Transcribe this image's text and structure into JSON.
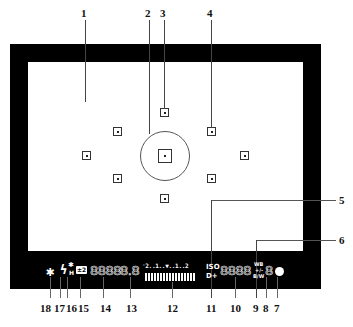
{
  "diagram": {
    "frame_color": "#000000",
    "background_color": "#ffffff",
    "callouts": [
      {
        "num": "1",
        "target": "focusing screen"
      },
      {
        "num": "2",
        "target": "spot metering circle"
      },
      {
        "num": "3",
        "target": "AF point"
      },
      {
        "num": "4",
        "target": "AF point"
      },
      {
        "num": "5",
        "target": "ISO / info indicator"
      },
      {
        "num": "6",
        "target": "WB / B/W indicator"
      },
      {
        "num": "7",
        "target": "focus confirmation light"
      },
      {
        "num": "8",
        "target": "max burst digit"
      },
      {
        "num": "9",
        "target": "WB correction / B/W indicator"
      },
      {
        "num": "10",
        "target": "ISO speed digits"
      },
      {
        "num": "11",
        "target": "ISO / D+ indicator"
      },
      {
        "num": "12",
        "target": "exposure level scale"
      },
      {
        "num": "13",
        "target": "aperture value"
      },
      {
        "num": "14",
        "target": "shutter speed"
      },
      {
        "num": "15",
        "target": "flash exposure compensation"
      },
      {
        "num": "16",
        "target": "high-speed sync / FE lock"
      },
      {
        "num": "17",
        "target": "flash ready"
      },
      {
        "num": "18",
        "target": "AE lock"
      }
    ],
    "lcd": {
      "ae_lock_icon": "✱",
      "flash_icon": "ϟ",
      "hss_icon_top": "✱",
      "hss_icon_bottom": "H",
      "fec_badge": "±2",
      "shutter_digits": "8888",
      "aperture_digits": "8.8",
      "exposure_scale": "⁻2..1..▼..1..2",
      "iso_label": "ISO",
      "dplus_label": "D+",
      "iso_digits": "8888",
      "wb_label": "WB",
      "pm_label": "+/-",
      "bw_label": "B/W",
      "burst_digit": "8",
      "focus_light": "●"
    }
  }
}
